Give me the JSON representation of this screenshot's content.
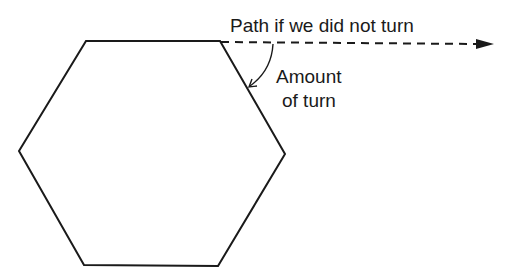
{
  "diagram": {
    "type": "geometry",
    "shape": "regular hexagon",
    "colors": {
      "background": "#ffffff",
      "stroke": "#1a1a1a"
    },
    "hexagon": {
      "vertices": [
        [
          86,
          41
        ],
        [
          220,
          41
        ],
        [
          285,
          154
        ],
        [
          218,
          266
        ],
        [
          84,
          265
        ],
        [
          19,
          151
        ]
      ]
    },
    "labels": {
      "path_label": "Path if we did not turn",
      "turn_label_line1": "Amount",
      "turn_label_line2": "of turn"
    },
    "extension_line": {
      "style": "dashed",
      "from": [
        220,
        44
      ],
      "to": [
        493,
        44
      ],
      "arrowhead": "right"
    },
    "turn_arrow": {
      "style": "curved arrow",
      "from": [
        274,
        46
      ],
      "to": [
        249,
        87
      ]
    }
  }
}
